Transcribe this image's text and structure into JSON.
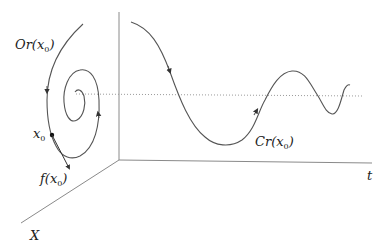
{
  "diagram": {
    "labels": {
      "orbit": {
        "main": "Or(x",
        "sub": "0",
        "close": ")"
      },
      "x0": {
        "main": "x",
        "sub": "0"
      },
      "f_x0": {
        "main": "f(x",
        "sub": "0",
        "close": ")"
      },
      "cr": {
        "main": "Cr(x",
        "sub": "0",
        "close": ")"
      },
      "t_axis": "t",
      "x_axis": "X"
    },
    "colors": {
      "axis": "#8a8a8a",
      "curve": "#555555",
      "dotted": "#9a9a9a",
      "text": "#222222"
    }
  }
}
